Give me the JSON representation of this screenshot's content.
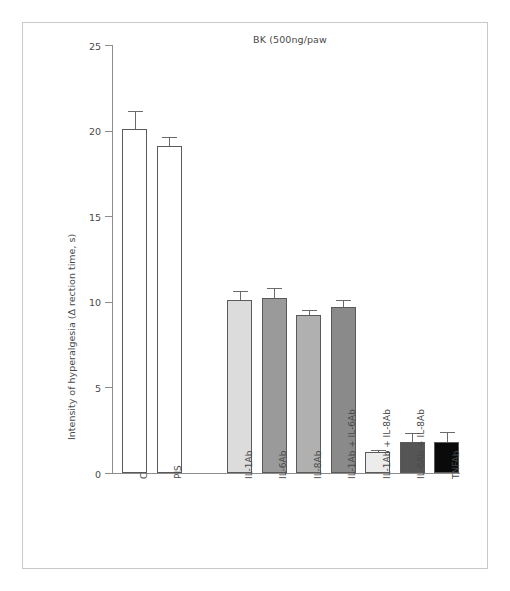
{
  "figure": {
    "background_color": "#ffffff",
    "frame_color": "#c9c9c9"
  },
  "chart_data": {
    "type": "bar",
    "title": "BK (500ng/paw",
    "xlabel": "",
    "ylabel": "Intensity of hyperalgesia (Δ rection time, s)",
    "ylim": [
      0,
      25
    ],
    "yticks": [
      0,
      5,
      10,
      15,
      20,
      25
    ],
    "ytick_labels": [
      "0",
      "5",
      "10",
      "15",
      "20",
      "25"
    ],
    "grid": false,
    "legend": false,
    "categories": [
      "C",
      "PIS",
      "IL-1Ab",
      "IL-6Ab",
      "IL-8Ab",
      "IL-1Ab + IL-6Ab",
      "IL-1Ab + IL-8Ab",
      "IL-6Ab + IL-8Ab",
      "TNFAb"
    ],
    "values": [
      20.1,
      19.1,
      10.1,
      10.2,
      9.2,
      9.7,
      1.2,
      1.8,
      1.8
    ],
    "errors": [
      1.05,
      0.5,
      0.55,
      0.6,
      0.35,
      0.4,
      0.12,
      0.55,
      0.6
    ],
    "bar_colors": [
      "#ffffff",
      "#ffffff",
      "#dcdcdc",
      "#9a9a9a",
      "#b0b0b0",
      "#8a8a8a",
      "#ececec",
      "#555555",
      "#0a0a0a"
    ],
    "bar_edge_color": "#5a5a5a",
    "error_color": "#6a6a6a",
    "axis_color": "#8d8d8d",
    "gap_after_index": 1
  }
}
